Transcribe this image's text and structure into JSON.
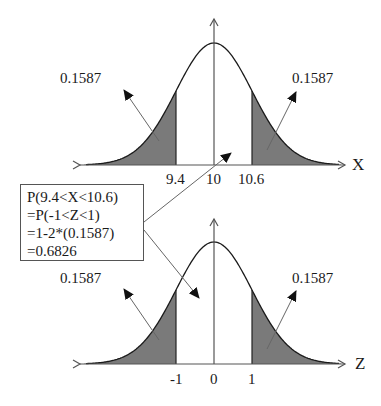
{
  "figure": {
    "top_panel": {
      "axis_label": "X",
      "tick_labels": [
        "9.4",
        "10",
        "10.6"
      ],
      "tail_left_label": "0.1587",
      "tail_right_label": "0.1587"
    },
    "bottom_panel": {
      "axis_label": "Z",
      "tick_labels": [
        "-1",
        "0",
        "1"
      ],
      "tail_left_label": "0.1587",
      "tail_right_label": "0.1587"
    },
    "callout": {
      "lines": [
        "P(9.4<X<10.6)",
        "=P(-1<Z<1)",
        "=1-2*(0.1587)",
        "=0.6826"
      ]
    },
    "colors": {
      "shade": "#7a7a7a",
      "curve": "#1a1a1a",
      "axis": "#555555",
      "arrow": "#666666"
    }
  },
  "chart_data": [
    {
      "type": "area",
      "title": "Normal distribution of X (mean 10, sd 0.6)",
      "xlabel": "X",
      "ylabel": "",
      "distribution": "normal",
      "mean": 10,
      "sd": 0.6,
      "ticks": [
        9.4,
        10,
        10.6
      ],
      "shaded_regions": [
        {
          "range": [
            "-inf",
            9.4
          ],
          "probability": 0.1587
        },
        {
          "range": [
            10.6,
            "inf"
          ],
          "probability": 0.1587
        }
      ],
      "annotations": [
        "0.1587",
        "0.1587"
      ]
    },
    {
      "type": "area",
      "title": "Standard normal distribution of Z",
      "xlabel": "Z",
      "ylabel": "",
      "distribution": "normal",
      "mean": 0,
      "sd": 1,
      "ticks": [
        -1,
        0,
        1
      ],
      "shaded_regions": [
        {
          "range": [
            "-inf",
            -1
          ],
          "probability": 0.1587
        },
        {
          "range": [
            1,
            "inf"
          ],
          "probability": 0.1587
        }
      ],
      "annotations": [
        "0.1587",
        "0.1587"
      ],
      "central_probability": 0.6826
    }
  ]
}
